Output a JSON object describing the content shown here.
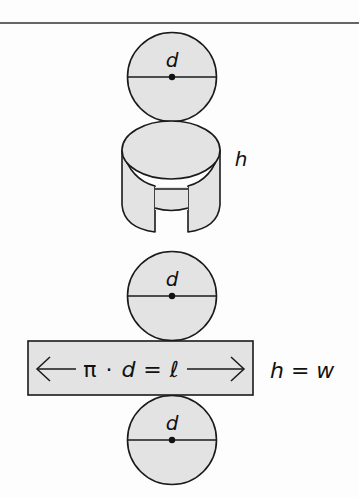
{
  "diagram": {
    "colors": {
      "fill": "#e3e3e3",
      "stroke": "#1a1a1a",
      "background": "#fdfdfd"
    },
    "top_circle": {
      "label": "d"
    },
    "cylinder": {
      "height_label": "h"
    },
    "middle_circle": {
      "label": "d"
    },
    "rectangle": {
      "formula_pi": "π",
      "formula_dot": "·",
      "formula_d": "d",
      "formula_eq": "=",
      "formula_l": "ℓ",
      "side_label": "h = w"
    },
    "bottom_circle": {
      "label": "d"
    }
  }
}
